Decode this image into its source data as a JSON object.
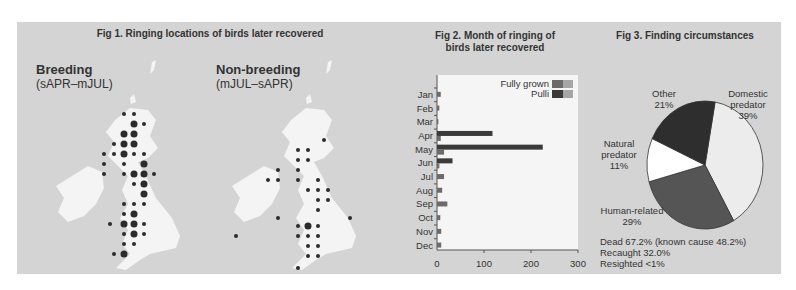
{
  "fig1": {
    "title": "Fig 1. Ringing locations of birds later recovered",
    "maps": [
      {
        "heading": "Breeding",
        "subheading": "(sAPR–mJUL)"
      },
      {
        "heading": "Non-breeding",
        "subheading": "(mJUL–sAPR)"
      }
    ]
  },
  "fig2": {
    "title_line1": "Fig 2. Month of ringing of",
    "title_line2": "birds later recovered",
    "legend": [
      {
        "label": "Fully grown",
        "color": "#6b6b6b"
      },
      {
        "label": "Pulli",
        "color": "#3a3a3a"
      }
    ]
  },
  "fig3": {
    "title": "Fig 3. Finding circumstances",
    "labels": {
      "domestic": [
        "Domestic",
        "predator",
        "39%"
      ],
      "other": [
        "Other",
        "21%"
      ],
      "natural": [
        "Natural",
        "predator",
        "11%"
      ],
      "human": [
        "Human-related",
        "29%"
      ]
    },
    "summary": [
      "Dead 67.2% (known cause 48.2%)",
      "Recaught 32.0%",
      "Resighted <1%"
    ]
  },
  "chart_data": [
    {
      "type": "bar",
      "title": "Fig 2. Month of ringing of birds later recovered",
      "orientation": "horizontal",
      "categories": [
        "Jan",
        "Feb",
        "Mar",
        "Apr",
        "May",
        "Jun",
        "Jul",
        "Aug",
        "Sep",
        "Oct",
        "Nov",
        "Dec"
      ],
      "series": [
        {
          "name": "Fully grown",
          "values": [
            8,
            5,
            3,
            8,
            15,
            5,
            15,
            11,
            22,
            7,
            9,
            9
          ]
        },
        {
          "name": "Pulli",
          "values": [
            0,
            0,
            0,
            118,
            225,
            33,
            0,
            0,
            0,
            0,
            0,
            0
          ]
        }
      ],
      "xlim": [
        0,
        300
      ],
      "xticks": [
        0,
        100,
        200,
        300
      ],
      "legend_position": "top-right"
    },
    {
      "type": "pie",
      "title": "Fig 3. Finding circumstances",
      "categories": [
        "Domestic predator",
        "Human-related",
        "Natural predator",
        "Other"
      ],
      "values": [
        39,
        29,
        11,
        21
      ],
      "colors": [
        "#ececec",
        "#555555",
        "#ffffff",
        "#2e2e2e"
      ],
      "annotations": [
        "Dead 67.2% (known cause 48.2%)",
        "Recaught 32.0%",
        "Resighted <1%"
      ]
    }
  ]
}
